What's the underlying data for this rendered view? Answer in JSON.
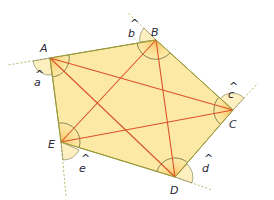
{
  "diagram": {
    "title": "",
    "colors": {
      "fill": "#fde9a6",
      "edge": "#9a9a3a",
      "diagonal": "#d9532a",
      "extension": "#b8b86a",
      "arc": "#6b6b3a",
      "text": "#2a2a3a"
    },
    "vertices": [
      {
        "id": "A",
        "label": "A",
        "x": 50,
        "y": 58,
        "lx": 40,
        "ly": 50
      },
      {
        "id": "B",
        "label": "B",
        "x": 156,
        "y": 40,
        "lx": 152,
        "ly": 35
      },
      {
        "id": "C",
        "label": "C",
        "x": 233,
        "y": 110,
        "lx": 230,
        "ly": 128
      },
      {
        "id": "D",
        "label": "D",
        "x": 175,
        "y": 177,
        "lx": 170,
        "ly": 195
      },
      {
        "id": "E",
        "label": "E",
        "x": 61,
        "y": 142,
        "lx": 49,
        "ly": 147
      }
    ],
    "exterior_angles": [
      {
        "vertex": "A",
        "label": "a",
        "hat": "^",
        "x": 36,
        "y": 80
      },
      {
        "vertex": "B",
        "label": "b",
        "hat": "^",
        "x": 128,
        "y": 35
      },
      {
        "vertex": "C",
        "label": "c",
        "hat": "^",
        "x": 230,
        "y": 93
      },
      {
        "vertex": "D",
        "label": "d",
        "hat": "^",
        "x": 204,
        "y": 170
      },
      {
        "vertex": "E",
        "label": "e",
        "hat": "^",
        "x": 81,
        "y": 170
      }
    ],
    "diagonals": [
      [
        "A",
        "C"
      ],
      [
        "A",
        "D"
      ],
      [
        "B",
        "D"
      ],
      [
        "B",
        "E"
      ],
      [
        "C",
        "E"
      ]
    ]
  }
}
